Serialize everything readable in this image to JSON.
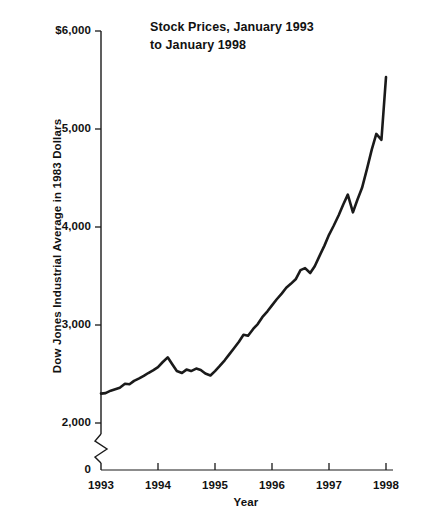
{
  "chart_data": {
    "type": "line",
    "title": "Stock Prices, January 1993\nto January 1998",
    "title_line1": "Stock Prices, January 1993",
    "title_line2": "to January 1998",
    "xlabel": "Year",
    "ylabel": "Dow Jones Industrial Average in 1983 Dollars",
    "xlim": [
      1993,
      1998.05
    ],
    "ylim": [
      2000,
      6000
    ],
    "y_axis_break": true,
    "y_break_note": "axis broken between 0 and 2,000",
    "grid": false,
    "legend": null,
    "y_ticks": [
      {
        "value": 6000,
        "label": "$6,000"
      },
      {
        "value": 5000,
        "label": "5,000"
      },
      {
        "value": 4000,
        "label": "4,000"
      },
      {
        "value": 3000,
        "label": "3,000"
      },
      {
        "value": 2000,
        "label": "2,000"
      },
      {
        "value": 0,
        "label": "0"
      }
    ],
    "x_ticks": [
      {
        "value": 1993,
        "label": "1993"
      },
      {
        "value": 1994,
        "label": "1994"
      },
      {
        "value": 1995,
        "label": "1995"
      },
      {
        "value": 1996,
        "label": "1996"
      },
      {
        "value": 1997,
        "label": "1997"
      },
      {
        "value": 1998,
        "label": "1998"
      }
    ],
    "series": [
      {
        "name": "Dow Jones Industrial Average in 1983 Dollars",
        "color": "#1a1a1a",
        "x": [
          1993.0,
          1993.08,
          1993.17,
          1993.25,
          1993.33,
          1993.42,
          1993.5,
          1993.58,
          1993.67,
          1993.75,
          1993.83,
          1993.92,
          1994.0,
          1994.08,
          1994.17,
          1994.25,
          1994.33,
          1994.42,
          1994.5,
          1994.58,
          1994.67,
          1994.75,
          1994.83,
          1994.92,
          1995.0,
          1995.08,
          1995.17,
          1995.25,
          1995.33,
          1995.42,
          1995.5,
          1995.58,
          1995.67,
          1995.75,
          1995.83,
          1995.92,
          1996.0,
          1996.08,
          1996.17,
          1996.25,
          1996.33,
          1996.42,
          1996.5,
          1996.58,
          1996.67,
          1996.75,
          1996.83,
          1996.92,
          1997.0,
          1997.08,
          1997.17,
          1997.25,
          1997.33,
          1997.42,
          1997.5,
          1997.58,
          1997.67,
          1997.75,
          1997.83,
          1997.92,
          1998.0
        ],
        "y": [
          2300,
          2305,
          2330,
          2345,
          2360,
          2400,
          2395,
          2430,
          2455,
          2480,
          2510,
          2540,
          2570,
          2620,
          2670,
          2600,
          2530,
          2510,
          2545,
          2530,
          2555,
          2540,
          2505,
          2485,
          2530,
          2580,
          2640,
          2700,
          2760,
          2830,
          2900,
          2890,
          2960,
          3010,
          3080,
          3140,
          3200,
          3260,
          3320,
          3380,
          3420,
          3470,
          3560,
          3580,
          3530,
          3600,
          3700,
          3810,
          3920,
          4010,
          4120,
          4230,
          4330,
          4150,
          4280,
          4400,
          4600,
          4790,
          4950,
          4890,
          5530
        ]
      }
    ],
    "annotations": {
      "start_value": 2300,
      "end_value": 5530,
      "peak_value": 5530,
      "minimum_value": 2300
    }
  },
  "axis": {
    "y_title": "Dow Jones Industrial Average in 1983 Dollars",
    "x_title": "Year"
  }
}
